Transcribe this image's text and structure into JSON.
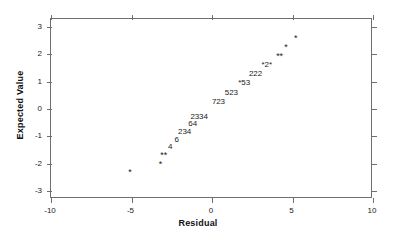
{
  "chart_data": {
    "type": "scatter",
    "title": "",
    "xlabel": "Residual",
    "ylabel": "Expected Value",
    "xlim": [
      -10,
      10
    ],
    "ylim": [
      -3.3,
      3.3
    ],
    "xticks": [
      -10,
      -5,
      0,
      5,
      10
    ],
    "yticks": [
      -3,
      -2,
      -1,
      0,
      1,
      2,
      3
    ],
    "xtick_labels": [
      "-10",
      "-5",
      "0",
      "5",
      "10"
    ],
    "ytick_labels": [
      "-3",
      "-2",
      "-1",
      "0",
      "1",
      "2",
      "3"
    ],
    "grid": false,
    "legend": null,
    "points": [
      {
        "label": "*",
        "x": -5.1,
        "y": -2.3
      },
      {
        "label": "*",
        "x": -3.2,
        "y": -2.0
      },
      {
        "label": "**",
        "x": -3.0,
        "y": -1.67
      },
      {
        "label": "4",
        "x": -2.6,
        "y": -1.4
      },
      {
        "label": "6",
        "x": -2.2,
        "y": -1.12
      },
      {
        "label": "234",
        "x": -1.7,
        "y": -0.85
      },
      {
        "label": "64",
        "x": -1.2,
        "y": -0.56
      },
      {
        "label": "2334",
        "x": -0.8,
        "y": -0.29
      },
      {
        "label": "723",
        "x": 0.4,
        "y": 0.25
      },
      {
        "label": "523",
        "x": 1.2,
        "y": 0.58
      },
      {
        "label": "*53",
        "x": 2.0,
        "y": 0.97
      },
      {
        "label": "222",
        "x": 2.7,
        "y": 1.27
      },
      {
        "label": "*2*",
        "x": 3.4,
        "y": 1.63
      },
      {
        "label": "**",
        "x": 4.2,
        "y": 1.93
      },
      {
        "label": "*",
        "x": 4.6,
        "y": 2.28
      },
      {
        "label": "*",
        "x": 5.2,
        "y": 2.62
      }
    ]
  },
  "axes": {
    "x_title": "Residual",
    "y_title": "Expected Value"
  }
}
